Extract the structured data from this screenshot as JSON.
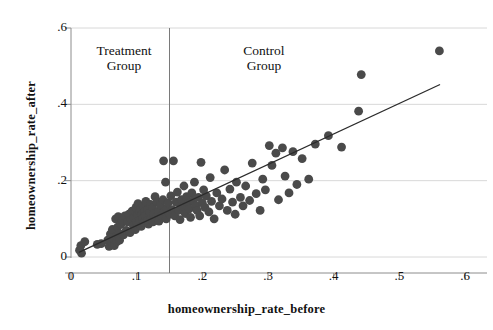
{
  "chart_data": {
    "type": "scatter",
    "title": "",
    "xlabel": "homeownership_rate_before",
    "ylabel": "homeownership_rate_after",
    "xlim": [
      0,
      0.6
    ],
    "ylim": [
      0,
      0.6
    ],
    "xticks": [
      0,
      0.1,
      0.2,
      0.3,
      0.4,
      0.5,
      0.6
    ],
    "xtick_labels": [
      "0",
      ".1",
      ".2",
      ".3",
      ".4",
      ".5",
      ".6"
    ],
    "yticks": [
      0,
      0.2,
      0.4,
      0.6
    ],
    "ytick_labels": [
      "0",
      ".2",
      ".4",
      ".6"
    ],
    "grid": "horizontal",
    "legend_position": "none",
    "marker_color": "#4a4a4a",
    "marker_size": 4.4,
    "line_color": "#2b2b2b",
    "gridline_color": "#d8d8d8",
    "axis_color": "#8c8c8c",
    "annotations": [
      {
        "name": "treatment-group",
        "text": "Treatment\nGroup",
        "x": 0.075,
        "y": 0.51
      },
      {
        "name": "control-group",
        "text": "Control\nGroup",
        "x": 0.292,
        "y": 0.51
      }
    ],
    "vline": {
      "x": 0.15,
      "color": "#7a7a7a",
      "label": "treatment cutoff"
    },
    "fit_line": {
      "name": "linear-fit",
      "x_start": 0.012,
      "y_start": 0.012,
      "x_end": 0.562,
      "y_end": 0.452
    },
    "points": [
      [
        0.013,
        0.018
      ],
      [
        0.015,
        0.03
      ],
      [
        0.016,
        0.01
      ],
      [
        0.021,
        0.04
      ],
      [
        0.04,
        0.033
      ],
      [
        0.046,
        0.035
      ],
      [
        0.056,
        0.044
      ],
      [
        0.058,
        0.028
      ],
      [
        0.06,
        0.06
      ],
      [
        0.062,
        0.038
      ],
      [
        0.063,
        0.072
      ],
      [
        0.065,
        0.046
      ],
      [
        0.066,
        0.03
      ],
      [
        0.068,
        0.1
      ],
      [
        0.069,
        0.054
      ],
      [
        0.07,
        0.04
      ],
      [
        0.071,
        0.078
      ],
      [
        0.072,
        0.106
      ],
      [
        0.073,
        0.062
      ],
      [
        0.074,
        0.044
      ],
      [
        0.076,
        0.086
      ],
      [
        0.078,
        0.096
      ],
      [
        0.08,
        0.058
      ],
      [
        0.082,
        0.108
      ],
      [
        0.084,
        0.07
      ],
      [
        0.086,
        0.092
      ],
      [
        0.088,
        0.112
      ],
      [
        0.09,
        0.064
      ],
      [
        0.091,
        0.098
      ],
      [
        0.093,
        0.12
      ],
      [
        0.095,
        0.082
      ],
      [
        0.096,
        0.104
      ],
      [
        0.098,
        0.072
      ],
      [
        0.099,
        0.13
      ],
      [
        0.1,
        0.092
      ],
      [
        0.101,
        0.11
      ],
      [
        0.102,
        0.14
      ],
      [
        0.103,
        0.088
      ],
      [
        0.104,
        0.118
      ],
      [
        0.105,
        0.096
      ],
      [
        0.106,
        0.126
      ],
      [
        0.107,
        0.08
      ],
      [
        0.108,
        0.112
      ],
      [
        0.109,
        0.102
      ],
      [
        0.11,
        0.134
      ],
      [
        0.111,
        0.09
      ],
      [
        0.112,
        0.12
      ],
      [
        0.113,
        0.108
      ],
      [
        0.114,
        0.146
      ],
      [
        0.116,
        0.096
      ],
      [
        0.117,
        0.124
      ],
      [
        0.118,
        0.086
      ],
      [
        0.12,
        0.116
      ],
      [
        0.121,
        0.138
      ],
      [
        0.122,
        0.1
      ],
      [
        0.124,
        0.128
      ],
      [
        0.125,
        0.092
      ],
      [
        0.126,
        0.112
      ],
      [
        0.128,
        0.158
      ],
      [
        0.13,
        0.104
      ],
      [
        0.131,
        0.144
      ],
      [
        0.133,
        0.12
      ],
      [
        0.134,
        0.094
      ],
      [
        0.136,
        0.136
      ],
      [
        0.138,
        0.108
      ],
      [
        0.14,
        0.15
      ],
      [
        0.141,
        0.252
      ],
      [
        0.142,
        0.118
      ],
      [
        0.144,
        0.196
      ],
      [
        0.145,
        0.1
      ],
      [
        0.146,
        0.128
      ],
      [
        0.148,
        0.142
      ],
      [
        0.15,
        0.112
      ],
      [
        0.152,
        0.16
      ],
      [
        0.154,
        0.124
      ],
      [
        0.156,
        0.252
      ],
      [
        0.158,
        0.108
      ],
      [
        0.16,
        0.144
      ],
      [
        0.162,
        0.17
      ],
      [
        0.164,
        0.122
      ],
      [
        0.166,
        0.098
      ],
      [
        0.168,
        0.15
      ],
      [
        0.17,
        0.132
      ],
      [
        0.172,
        0.186
      ],
      [
        0.174,
        0.114
      ],
      [
        0.176,
        0.158
      ],
      [
        0.178,
        0.14
      ],
      [
        0.18,
        0.126
      ],
      [
        0.182,
        0.104
      ],
      [
        0.184,
        0.168
      ],
      [
        0.186,
        0.148
      ],
      [
        0.188,
        0.196
      ],
      [
        0.19,
        0.134
      ],
      [
        0.192,
        0.122
      ],
      [
        0.194,
        0.156
      ],
      [
        0.196,
        0.108
      ],
      [
        0.198,
        0.248
      ],
      [
        0.2,
        0.142
      ],
      [
        0.202,
        0.176
      ],
      [
        0.204,
        0.13
      ],
      [
        0.206,
        0.16
      ],
      [
        0.21,
        0.118
      ],
      [
        0.212,
        0.208
      ],
      [
        0.214,
        0.146
      ],
      [
        0.218,
        0.1
      ],
      [
        0.222,
        0.168
      ],
      [
        0.226,
        0.134
      ],
      [
        0.23,
        0.152
      ],
      [
        0.234,
        0.228
      ],
      [
        0.238,
        0.122
      ],
      [
        0.242,
        0.178
      ],
      [
        0.246,
        0.144
      ],
      [
        0.25,
        0.112
      ],
      [
        0.252,
        0.196
      ],
      [
        0.258,
        0.156
      ],
      [
        0.262,
        0.134
      ],
      [
        0.266,
        0.186
      ],
      [
        0.272,
        0.148
      ],
      [
        0.276,
        0.246
      ],
      [
        0.282,
        0.166
      ],
      [
        0.288,
        0.122
      ],
      [
        0.292,
        0.204
      ],
      [
        0.296,
        0.176
      ],
      [
        0.302,
        0.292
      ],
      [
        0.306,
        0.24
      ],
      [
        0.312,
        0.272
      ],
      [
        0.316,
        0.15
      ],
      [
        0.322,
        0.286
      ],
      [
        0.326,
        0.212
      ],
      [
        0.332,
        0.168
      ],
      [
        0.338,
        0.276
      ],
      [
        0.344,
        0.19
      ],
      [
        0.352,
        0.258
      ],
      [
        0.362,
        0.204
      ],
      [
        0.372,
        0.296
      ],
      [
        0.392,
        0.318
      ],
      [
        0.412,
        0.288
      ],
      [
        0.438,
        0.382
      ],
      [
        0.442,
        0.478
      ],
      [
        0.561,
        0.54
      ]
    ]
  }
}
